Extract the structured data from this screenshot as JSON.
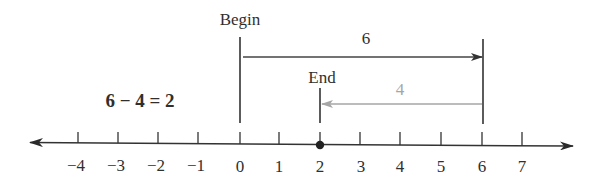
{
  "equation": "6 − 4 = 2",
  "labels": {
    "begin": "Begin",
    "end": "End",
    "first_move": "6",
    "second_move": "4"
  },
  "number_line": {
    "min_tick": -4,
    "max_tick": 7,
    "ticks": [
      "−4",
      "−3",
      "−2",
      "−1",
      "0",
      "1",
      "2",
      "3",
      "4",
      "5",
      "6",
      "7"
    ],
    "highlighted_point": "2",
    "arrows_both_ends": true
  },
  "moves": [
    {
      "from": 0,
      "to": 6,
      "length": "6",
      "direction": "right",
      "color": "#3a3a3a"
    },
    {
      "from": 6,
      "to": 2,
      "length": "4",
      "direction": "left",
      "color": "#a6a6a6"
    }
  ],
  "colors": {
    "ink": "#2f2f2f",
    "gray_arrow": "#a6a6a6",
    "background": "#ffffff"
  }
}
